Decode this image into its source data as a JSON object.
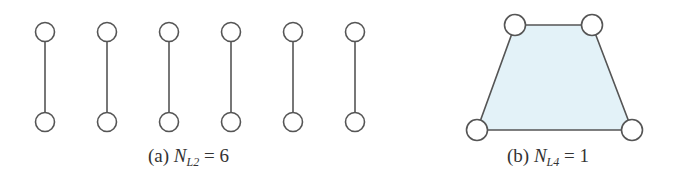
{
  "colors": {
    "stroke": "#555555",
    "node_fill": "#ffffff",
    "face_fill": "#e3f2f8"
  },
  "panel_a": {
    "label": "(a)",
    "variable": "N",
    "subscript": "L2",
    "equals": "= 6",
    "edges": [
      {
        "x": 45,
        "y1": 32,
        "y2": 122
      },
      {
        "x": 107,
        "y1": 32,
        "y2": 122
      },
      {
        "x": 169,
        "y1": 32,
        "y2": 122
      },
      {
        "x": 231,
        "y1": 32,
        "y2": 122
      },
      {
        "x": 293,
        "y1": 32,
        "y2": 122
      },
      {
        "x": 355,
        "y1": 32,
        "y2": 122
      }
    ]
  },
  "panel_b": {
    "label": "(b)",
    "variable": "N",
    "subscript": "L4",
    "equals": "= 1",
    "nodes": [
      {
        "x": 515,
        "y": 25
      },
      {
        "x": 592,
        "y": 25
      },
      {
        "x": 632,
        "y": 130
      },
      {
        "x": 477,
        "y": 130
      }
    ]
  }
}
